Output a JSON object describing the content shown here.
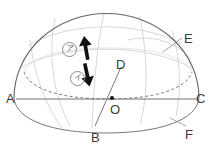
{
  "figure": {
    "background_color": "#ffffff",
    "outline_color": "#555555",
    "faint_line_color": "#cfcfcf",
    "arrow_color": "#111111",
    "label_color": "#3a3a3a",
    "circle_label_color": "#6f6f6f"
  },
  "points": {
    "A": {
      "label": "A",
      "x": 6,
      "y": 92
    },
    "B": {
      "label": "B",
      "x": 91,
      "y": 131
    },
    "C": {
      "label": "C",
      "x": 196,
      "y": 92
    },
    "D": {
      "label": "D",
      "x": 116,
      "y": 58
    },
    "E": {
      "label": "E",
      "x": 184,
      "y": 32
    },
    "F": {
      "label": "F",
      "x": 185,
      "y": 128
    },
    "O": {
      "label": "O",
      "x": 110,
      "y": 103
    }
  },
  "annotations": [
    {
      "name": "circled-a",
      "label": "ア",
      "x": 62,
      "y": 42
    },
    {
      "name": "circled-i",
      "label": "イ",
      "x": 70,
      "y": 71
    }
  ],
  "arrows": [
    {
      "name": "up-arrow",
      "direction": "up"
    },
    {
      "name": "down-arrow",
      "direction": "down"
    }
  ],
  "geometry": {
    "horizon_label": "horizon line A-C",
    "center_point_label": "O",
    "dome_label": "hemispherical dome",
    "equator_label": "dashed equator ellipse",
    "meridian_label": "meridian arc"
  }
}
